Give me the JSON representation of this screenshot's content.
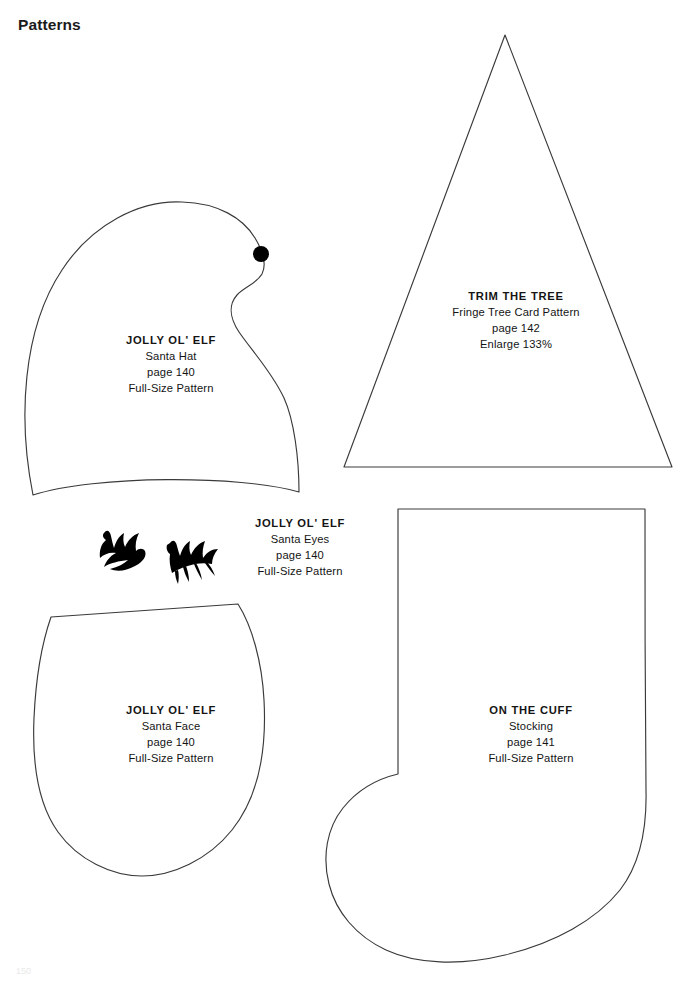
{
  "page": {
    "title": "Patterns",
    "folio": "150",
    "background_color": "#ffffff",
    "ink_color": "#3a3a3a",
    "text_color": "#141414"
  },
  "patterns": [
    {
      "id": "santa-hat",
      "shape": "dome-with-notch",
      "title": "JOLLY OL' ELF",
      "line2": "Santa Hat",
      "line3": "page 140",
      "line4": "Full-Size Pattern",
      "marker": "pom-pom-dot"
    },
    {
      "id": "fringe-tree",
      "shape": "triangle",
      "title": "TRIM THE TREE",
      "line2": "Fringe Tree Card Pattern",
      "line3": "page 142",
      "line4": "Enlarge 133%"
    },
    {
      "id": "santa-eyes",
      "shape": "eye-glyphs",
      "title": "JOLLY OL' ELF",
      "line2": "Santa Eyes",
      "line3": "page 140",
      "line4": "Full-Size Pattern"
    },
    {
      "id": "santa-face",
      "shape": "u-shape",
      "title": "JOLLY OL' ELF",
      "line2": "Santa Face",
      "line3": "page 140",
      "line4": "Full-Size Pattern"
    },
    {
      "id": "stocking",
      "shape": "stocking",
      "title": "ON THE CUFF",
      "line2": "Stocking",
      "line3": "page 141",
      "line4": "Full-Size Pattern"
    }
  ]
}
